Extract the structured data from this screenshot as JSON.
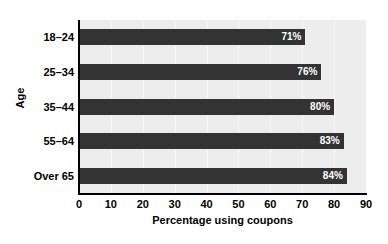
{
  "chart_data": {
    "type": "bar",
    "orientation": "horizontal",
    "title": "",
    "xlabel": "Percentage using coupons",
    "ylabel": "Age",
    "categories": [
      "18–24",
      "25–34",
      "35–44",
      "55–64",
      "Over 65"
    ],
    "values": [
      71,
      76,
      80,
      83,
      84
    ],
    "data_labels": [
      "71%",
      "76%",
      "80%",
      "83%",
      "84%"
    ],
    "xlim": [
      0,
      90
    ],
    "ylim": null,
    "xticks": [
      0,
      10,
      20,
      30,
      40,
      50,
      60,
      70,
      80,
      90
    ],
    "xtick_labels": [
      "0",
      "10",
      "20",
      "30",
      "40",
      "50",
      "60",
      "70",
      "80",
      "90"
    ],
    "grid": "vertical",
    "legend": null,
    "colors": {
      "bar": "#333333",
      "plot_background": "#ededed",
      "gridline": "#f8f8f8",
      "axis": "#000000",
      "data_label_text": "#ffffff",
      "figure_background": "#ffffff"
    }
  }
}
